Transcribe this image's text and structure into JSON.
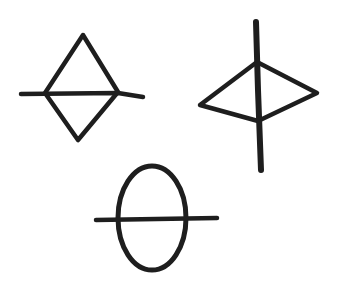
{
  "canvas": {
    "width": 340,
    "height": 290,
    "background": "#ffffff"
  },
  "ink_color": "#1e1e1e",
  "symbols": [
    {
      "name": "diamond-with-horizontal-line",
      "description": "Hand-drawn diamond (rhombus) bisected by a horizontal line extending beyond both sides",
      "shape": {
        "top": [
          83,
          35
        ],
        "right": [
          118,
          92
        ],
        "bottom": [
          78,
          140
        ],
        "left": [
          45,
          93
        ]
      },
      "line": {
        "from": [
          21,
          94
        ],
        "to": [
          143,
          97
        ]
      },
      "stroke_width": 4.5
    },
    {
      "name": "kite-with-vertical-line",
      "description": "Hand-drawn kite/quadrilateral pointing left and right, bisected by a long vertical line",
      "shape": {
        "top": [
          257,
          62
        ],
        "right": [
          317,
          93
        ],
        "bottom": [
          258,
          121
        ],
        "left": [
          200,
          105
        ]
      },
      "line": {
        "from": [
          256,
          22
        ],
        "to": [
          261,
          170
        ]
      },
      "stroke_width": 5
    },
    {
      "name": "ellipse-with-horizontal-line",
      "description": "Hand-drawn vertical ellipse bisected by a horizontal line extending beyond both sides",
      "shape": {
        "cx": 152,
        "cy": 218,
        "rx": 34,
        "ry": 52
      },
      "line": {
        "from": [
          96,
          220
        ],
        "to": [
          217,
          218
        ]
      },
      "stroke_width": 5
    }
  ]
}
